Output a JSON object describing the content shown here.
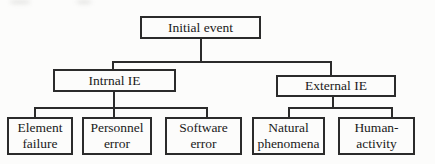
{
  "colors": {
    "line": "#2b2b2b",
    "text": "#1a1a1a",
    "bg": "#fcfcfb"
  },
  "diagram": {
    "type": "tree",
    "nodes": {
      "initial_event": {
        "label": "Initial event"
      },
      "internal_ie": {
        "label": "Intrnal IE"
      },
      "external_ie": {
        "label": "External IE"
      },
      "element_failure": {
        "label": "Element failure"
      },
      "personnel_error": {
        "label": "Personnel error"
      },
      "software_error": {
        "label": "Software error"
      },
      "natural_phenomena": {
        "label": "Natural phenomena"
      },
      "human_activity": {
        "label": "Human-activity"
      }
    },
    "edges": [
      [
        "initial_event",
        "internal_ie"
      ],
      [
        "initial_event",
        "external_ie"
      ],
      [
        "internal_ie",
        "element_failure"
      ],
      [
        "internal_ie",
        "personnel_error"
      ],
      [
        "internal_ie",
        "software_error"
      ],
      [
        "external_ie",
        "natural_phenomena"
      ],
      [
        "external_ie",
        "human_activity"
      ]
    ]
  }
}
